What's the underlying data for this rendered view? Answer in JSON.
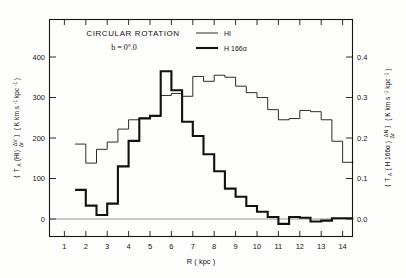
{
  "figure": {
    "title": "CIRCULAR  ROTATION",
    "subtitle": "b = 0°.0",
    "background_color": "#fdfdfc",
    "line_color": "#151515"
  },
  "legend": {
    "position": "top-center",
    "entries": [
      {
        "label": "HI",
        "style": "thin",
        "line_width": 0.9
      },
      {
        "label": "H 166α",
        "style": "thick",
        "line_width": 2.1
      }
    ]
  },
  "axes": {
    "x": {
      "label": "R ( kpc )",
      "ticks": [
        "1",
        "2",
        "3",
        "4",
        "5",
        "6",
        "7",
        "8",
        "9",
        "10",
        "11",
        "12",
        "13",
        "14"
      ],
      "range": [
        0.3,
        14.8
      ]
    },
    "y_left": {
      "label_parts": {
        "open_bracket": "⟨",
        "main": "T",
        "sub": "A",
        "species": "(HI)",
        "frac_num": "ΔV",
        "frac_den": "Δr",
        "close_bracket": "⟩",
        "units": "( K  km s",
        "units_exp1": "-1",
        "units_mid": " kpc",
        "units_exp2": "-1",
        "units_close": ")"
      },
      "label_plain": "⟨ T_A (HI) ΔV/Δr ⟩ ( K km s⁻¹ kpc⁻¹ )",
      "ticks": [
        "0",
        "100",
        "200",
        "300",
        "400"
      ],
      "range": [
        -60,
        460
      ]
    },
    "y_right": {
      "label_parts": {
        "open_bracket": "⟨",
        "main": "T",
        "sub": "A",
        "species": "( H 166α )",
        "frac_num": "ΔN",
        "frac_den": "Δr",
        "close_bracket": "⟩",
        "units": "( K  km s",
        "units_exp1": "-1",
        "units_mid": " kpc",
        "units_exp2": "-1",
        "units_close": ")"
      },
      "label_plain": "⟨ T_A ( H 166α ) ΔN/Δr ⟩ ( K km s⁻¹ kpc⁻¹ )",
      "ticks": [
        "0.0",
        "0.1",
        "0.2",
        "0.3",
        "0.4"
      ],
      "range": [
        -0.06,
        0.46
      ]
    }
  },
  "chart_data": {
    "type": "line",
    "subtype": "step-histogram",
    "title": "CIRCULAR ROTATION",
    "subtitle": "b = 0°.0",
    "xlabel": "R ( kpc )",
    "ylabel": "⟨ T_A (HI) ΔV/Δr ⟩ ( K km s^-1 kpc^-1 )",
    "ylabel_right": "⟨ T_A ( H 166α ) ΔN/Δr ⟩ ( K km s^-1 kpc^-1 )",
    "xlim": [
      0.3,
      14.8
    ],
    "ylim": [
      -60,
      460
    ],
    "ylim_right": [
      -0.06,
      0.46
    ],
    "grid": false,
    "legend_position": "top-center",
    "bin_width": 0.5,
    "series": [
      {
        "name": "HI",
        "axis": "left",
        "line_width": 0.9,
        "bin_edges": [
          1.5,
          2.0,
          2.5,
          3.0,
          3.5,
          4.0,
          4.5,
          5.0,
          5.5,
          6.0,
          6.5,
          7.0,
          7.5,
          8.0,
          8.5,
          9.0,
          9.5,
          10.0,
          10.5,
          11.0,
          11.5,
          12.0,
          12.5,
          13.0,
          13.5,
          14.0
        ],
        "values": [
          185,
          138,
          172,
          190,
          222,
          245,
          250,
          253,
          305,
          310,
          303,
          352,
          340,
          355,
          350,
          328,
          312,
          300,
          270,
          245,
          248,
          268,
          265,
          245,
          192,
          140
        ]
      },
      {
        "name": "H 166α",
        "axis": "right",
        "line_width": 2.1,
        "bin_edges": [
          1.5,
          2.0,
          2.5,
          3.0,
          3.5,
          4.0,
          4.5,
          5.0,
          5.5,
          6.0,
          6.5,
          7.0,
          7.5,
          8.0,
          8.5,
          9.0,
          9.5,
          10.0,
          10.5,
          11.0,
          11.5,
          12.0,
          12.5,
          13.0,
          13.5,
          14.0
        ],
        "values_left_scale": [
          72,
          33,
          10,
          38,
          130,
          193,
          248,
          255,
          365,
          318,
          240,
          205,
          160,
          118,
          75,
          55,
          32,
          18,
          5,
          -12,
          5,
          3,
          -6,
          -4,
          2,
          2
        ],
        "values_right_scale": [
          0.072,
          0.033,
          0.01,
          0.038,
          0.13,
          0.193,
          0.248,
          0.255,
          0.365,
          0.318,
          0.24,
          0.205,
          0.16,
          0.118,
          0.075,
          0.055,
          0.032,
          0.018,
          0.005,
          -0.012,
          0.005,
          0.003,
          -0.006,
          -0.004,
          0.002,
          0.002
        ]
      }
    ],
    "annotations": [
      {
        "text": "CIRCULAR ROTATION",
        "x": 3.9,
        "y": 432
      },
      {
        "text": "b = 0°.0",
        "x": 3.6,
        "y": 400
      }
    ]
  }
}
